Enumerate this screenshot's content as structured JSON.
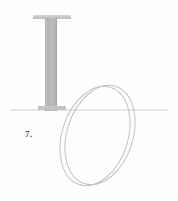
{
  "figure": {
    "label": "7.",
    "kind": "line-diagram",
    "background_color": "#fefefe",
    "ground_line": {
      "name": "ground-line",
      "x_start": 10,
      "x_end": 168,
      "y": 110,
      "color": "#cfcfcf",
      "stroke_width": 1
    },
    "column": {
      "name": "vertical-column",
      "shaft": {
        "x": 45,
        "y": 18,
        "width": 12,
        "height": 93,
        "fill_color": "#b9b9b9",
        "edge_color": "#a6a6a6"
      },
      "top_flange": {
        "x": 33,
        "y": 15,
        "width": 38,
        "height": 4,
        "fill_color": "#c9c9c9"
      },
      "base_flange": {
        "x": 38,
        "y": 106,
        "width": 28,
        "height": 4,
        "fill_color": "#c4c4c4"
      }
    },
    "ring": {
      "name": "tilted-ring",
      "stroke_color": "#c2c2c2",
      "stroke_width": 1,
      "outer_ellipse": {
        "cx": 100,
        "cy": 135,
        "rx": 33,
        "ry": 51,
        "rotation_deg": 18
      },
      "inner_ellipse": {
        "cx": 95,
        "cy": 136,
        "rx": 33,
        "ry": 51,
        "rotation_deg": 18
      }
    },
    "colors": {
      "line": "#c2c2c2",
      "ground": "#cfcfcf",
      "column_fill": "#b9b9b9",
      "label_text": "#4a4a4a"
    }
  }
}
